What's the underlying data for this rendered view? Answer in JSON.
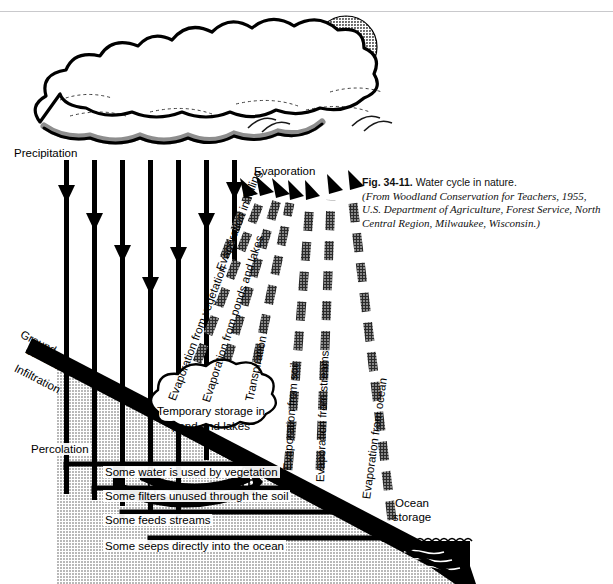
{
  "figure": {
    "number": "Fig. 34-11.",
    "title": "Water cycle in nature.",
    "source": "(From Woodland Conservation for Teachers, 1955, U.S. Department of Agriculture, Forest Service, North Central Region, Milwaukee, Wisconsin.)"
  },
  "labels": {
    "precipitation": "Precipitation",
    "evaporation_heading": "Evaporation",
    "ground_surface": "Ground surface",
    "infiltration": "Infiltration",
    "percolation": "Percolation",
    "surface_runoff_a": "Surface",
    "surface_runoff_b": "runoff",
    "ocean_storage": "Ocean storage",
    "temporary_storage": "Temporary storage in pond and lakes"
  },
  "evaporation_arrows": [
    {
      "label": "Evaporation in falling"
    },
    {
      "label": "Evaporation from vegetation"
    },
    {
      "label": "Evaporation from ponds and lakes"
    },
    {
      "label": "Transpiration"
    },
    {
      "label": "Evaporation from soil"
    },
    {
      "label": "Evaporation from streams"
    },
    {
      "label": "Evaporation from ocean"
    }
  ],
  "subsurface_paths": [
    {
      "label": "Some water is used by vegetation"
    },
    {
      "label": "Some filters unused through the soil"
    },
    {
      "label": "Some feeds streams"
    },
    {
      "label": "Some seeps directly into the ocean"
    }
  ],
  "colors": {
    "ink": "#000000",
    "ground_fill": "#b9b9b9",
    "sun": "#6a6a6a",
    "cloud_shadow": "#8e8e8e",
    "paper": "#ffffff"
  },
  "counts": {
    "precipitation_arrows": 7,
    "evaporation_arrows": 7,
    "trees": 2
  }
}
